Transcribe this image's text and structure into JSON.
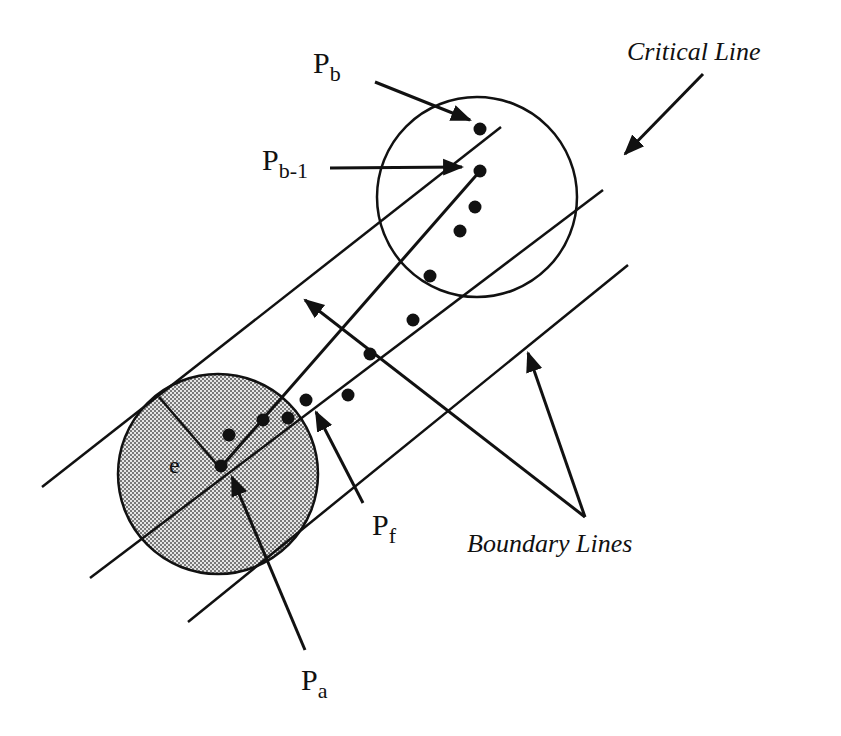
{
  "diagram": {
    "type": "geometric-figure",
    "colors": {
      "ink": "#111111",
      "shade": "#bdbdbd",
      "background": "#ffffff"
    },
    "labels": {
      "pb": {
        "main": "P",
        "sub": "b"
      },
      "pb1": {
        "main": "P",
        "sub": "b-1"
      },
      "pf": {
        "main": "P",
        "sub": "f"
      },
      "pa": {
        "main": "P",
        "sub": "a"
      },
      "e": "e",
      "critical_line": "Critical Line",
      "boundary_lines": "Boundary Lines"
    },
    "circles": [
      {
        "name": "end-circle",
        "cx": 477,
        "cy": 197,
        "r": 100,
        "shaded": false
      },
      {
        "name": "start-circle",
        "cx": 218,
        "cy": 474,
        "r": 100,
        "shaded": true
      }
    ],
    "points": [
      {
        "name": "Pb",
        "x": 480,
        "y": 129
      },
      {
        "name": "Pb-1",
        "x": 480,
        "y": 171
      },
      {
        "name": "p3",
        "x": 475,
        "y": 207
      },
      {
        "name": "p4",
        "x": 460,
        "y": 231
      },
      {
        "name": "p5",
        "x": 430,
        "y": 276
      },
      {
        "name": "p6",
        "x": 413,
        "y": 320
      },
      {
        "name": "p7",
        "x": 370,
        "y": 354
      },
      {
        "name": "p8",
        "x": 348,
        "y": 395
      },
      {
        "name": "Pf",
        "x": 306,
        "y": 400
      },
      {
        "name": "p10",
        "x": 288,
        "y": 418
      },
      {
        "name": "p11",
        "x": 263,
        "y": 420
      },
      {
        "name": "p12",
        "x": 229,
        "y": 435
      },
      {
        "name": "Pa",
        "x": 221,
        "y": 466
      }
    ]
  }
}
